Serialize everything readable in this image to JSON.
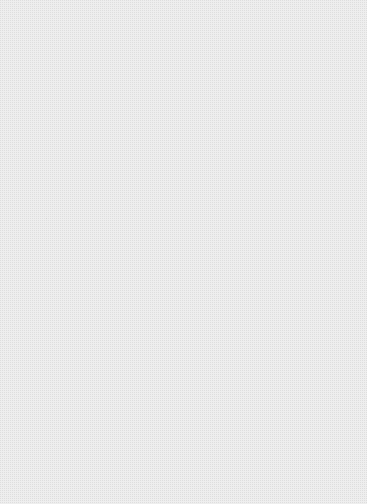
{
  "figure": {
    "title": "",
    "caption": "",
    "kind": "3d-parametric-surface-plot",
    "render_style": "shaded-quad-mesh-wireframe",
    "colorspace": "grayscale",
    "canvas": {
      "width": 367,
      "height": 504
    },
    "background_color": "#ffffff",
    "mesh_line_color": "#0d0d0d"
  },
  "chart_data": {
    "type": "surface3d",
    "title": "",
    "xlabel": "",
    "ylabel": "",
    "zlabel": "",
    "grid": true,
    "legend": false,
    "shading_range": [
      "#151515",
      "#d8d8d8"
    ],
    "light_direction": "upper-right",
    "cusp_point": {
      "x": 46,
      "y": 218
    },
    "lobes": [
      {
        "name": "upper-lobe",
        "mesh_u_divisions": 9,
        "mesh_v_divisions": 7,
        "bounds": {
          "x": 22,
          "y": 14,
          "width": 308,
          "height": 268
        },
        "outer_rim": [
          [
            46,
            218
          ],
          [
            34,
            186
          ],
          [
            28,
            160
          ],
          [
            30,
            132
          ],
          [
            42,
            104
          ],
          [
            62,
            78
          ],
          [
            90,
            52
          ],
          [
            124,
            32
          ],
          [
            160,
            20
          ],
          [
            196,
            16
          ],
          [
            230,
            20
          ],
          [
            262,
            34
          ],
          [
            288,
            56
          ],
          [
            308,
            84
          ],
          [
            320,
            116
          ],
          [
            326,
            150
          ],
          [
            322,
            186
          ],
          [
            310,
            216
          ],
          [
            292,
            244
          ],
          [
            272,
            262
          ],
          [
            250,
            274
          ],
          [
            228,
            278
          ]
        ],
        "inner_rim": [
          [
            46,
            218
          ],
          [
            60,
            222
          ],
          [
            82,
            232
          ],
          [
            108,
            244
          ],
          [
            138,
            254
          ],
          [
            170,
            262
          ],
          [
            200,
            268
          ],
          [
            226,
            272
          ],
          [
            250,
            274
          ],
          [
            272,
            262
          ],
          [
            292,
            244
          ],
          [
            310,
            216
          ]
        ],
        "shade_stops": [
          {
            "t": 0.0,
            "color": "#141414"
          },
          {
            "t": 0.18,
            "color": "#3a3a3a"
          },
          {
            "t": 0.4,
            "color": "#7a7a7a"
          },
          {
            "t": 0.62,
            "color": "#9a9a9a"
          },
          {
            "t": 0.82,
            "color": "#c2c2c2"
          },
          {
            "t": 1.0,
            "color": "#d6d6d6"
          }
        ]
      },
      {
        "name": "lower-lobe",
        "mesh_u_divisions": 22,
        "mesh_v_divisions": 11,
        "bounds": {
          "x": 26,
          "y": 232,
          "width": 316,
          "height": 266
        },
        "outer_rim": [
          [
            46,
            218
          ],
          [
            40,
            252
          ],
          [
            36,
            286
          ],
          [
            38,
            320
          ],
          [
            48,
            356
          ],
          [
            66,
            392
          ],
          [
            92,
            424
          ],
          [
            124,
            452
          ],
          [
            160,
            472
          ],
          [
            196,
            484
          ],
          [
            230,
            486
          ],
          [
            262,
            478
          ],
          [
            290,
            462
          ],
          [
            312,
            440
          ],
          [
            328,
            412
          ],
          [
            338,
            382
          ],
          [
            340,
            352
          ],
          [
            334,
            326
          ],
          [
            322,
            310
          ],
          [
            306,
            302
          ]
        ],
        "inner_rim": [
          [
            46,
            218
          ],
          [
            66,
            244
          ],
          [
            92,
            272
          ],
          [
            122,
            296
          ],
          [
            156,
            316
          ],
          [
            192,
            330
          ],
          [
            226,
            338
          ],
          [
            258,
            340
          ],
          [
            284,
            332
          ],
          [
            300,
            318
          ],
          [
            306,
            302
          ]
        ],
        "shade_stops": [
          {
            "t": 0.0,
            "color": "#121212"
          },
          {
            "t": 0.2,
            "color": "#3c3c3c"
          },
          {
            "t": 0.45,
            "color": "#787878"
          },
          {
            "t": 0.7,
            "color": "#9c9c9c"
          },
          {
            "t": 0.9,
            "color": "#b8b8b8"
          },
          {
            "t": 1.0,
            "color": "#c8c8c8"
          }
        ]
      }
    ]
  },
  "labels": {
    "axis_ticks": [],
    "annotations": [],
    "legend_entries": []
  }
}
